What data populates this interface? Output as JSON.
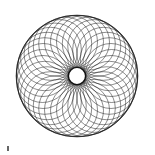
{
  "image": {
    "title": "Spirograph Guilloche Rose",
    "width": 155,
    "height": 155,
    "background_color": "#ffffff",
    "alt_text": "Dense woven lattice of overlapping circles forming a round rose pattern with a small white hole at the centre"
  },
  "figure": {
    "name": "guilloche-rose",
    "stroke_color": "#1c1c1c",
    "stroke_width": 0.55,
    "stroke_opacity": 0.92,
    "fill": "none"
  },
  "geometry": {
    "center_x": 77,
    "center_y": 76,
    "outer_radius": 61,
    "inner_hole_radius": 8,
    "circle_count": 36,
    "circle_radius": 26.5,
    "center_ring_radius": 34.5,
    "start_angle_deg": 0,
    "rim_ring_radius": 60.5,
    "rim_stroke_width": 1.1,
    "rim_stroke_color": "#141414",
    "hub_ring_radius": 8.6,
    "hub_stroke_width": 1.4,
    "hub_stroke_color": "#111111",
    "hub_fill": "#ffffff"
  },
  "artifact": {
    "name": "scan-speck",
    "x": 7,
    "y": 146,
    "width": 2,
    "height": 5,
    "color": "#4a4a4a"
  },
  "chart_data": {
    "type": "scatter",
    "title": "Spirograph Guilloche Rose",
    "xlabel": "",
    "ylabel": "",
    "xlim": [
      16,
      138
    ],
    "ylim": [
      15,
      137
    ],
    "grid": false,
    "legend": null,
    "annotations": [],
    "series": [
      {
        "name": "circle-centers",
        "description": "Centres of the 36 generating circles, evenly spaced on a ring of radius 34.5 around (77,76)",
        "values": [
          [
            111.5,
            76.0
          ],
          [
            110.8,
            81.9
          ],
          [
            108.9,
            87.5
          ],
          [
            105.9,
            92.6
          ],
          [
            101.9,
            96.9
          ],
          [
            97.1,
            100.3
          ],
          [
            91.6,
            102.6
          ],
          [
            85.8,
            103.8
          ],
          [
            79.9,
            103.7
          ],
          [
            74.1,
            102.5
          ],
          [
            68.6,
            100.1
          ],
          [
            63.8,
            96.6
          ],
          [
            59.9,
            92.2
          ],
          [
            56.9,
            87.1
          ],
          [
            55.1,
            81.5
          ],
          [
            54.5,
            75.6
          ],
          [
            55.2,
            69.8
          ],
          [
            57.1,
            64.2
          ],
          [
            60.1,
            59.1
          ],
          [
            64.1,
            54.8
          ],
          [
            68.9,
            51.4
          ],
          [
            74.4,
            49.1
          ],
          [
            80.2,
            47.9
          ],
          [
            86.1,
            48.0
          ],
          [
            91.9,
            49.2
          ],
          [
            97.4,
            51.6
          ],
          [
            102.2,
            55.1
          ],
          [
            106.1,
            59.5
          ],
          [
            109.1,
            64.6
          ],
          [
            110.9,
            70.2
          ],
          [
            111.5,
            76.1
          ],
          [
            110.8,
            81.9
          ],
          [
            108.9,
            87.5
          ],
          [
            105.9,
            92.6
          ],
          [
            101.9,
            96.9
          ],
          [
            97.1,
            100.3
          ]
        ]
      }
    ]
  }
}
